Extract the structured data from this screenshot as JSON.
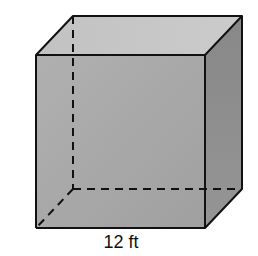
{
  "figure": {
    "shape": "cube",
    "dimension_label": "12 ft",
    "colors": {
      "front_face": "#a8a8a8",
      "top_face": "#c6c6c6",
      "right_face": "#8c8c8c",
      "edge": "#111111",
      "background": "#ffffff"
    }
  }
}
